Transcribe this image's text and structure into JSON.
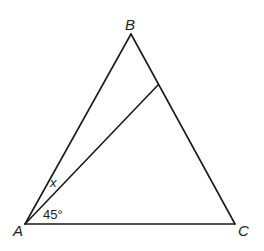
{
  "diagram": {
    "type": "triangle",
    "vertices": {
      "A": {
        "label": "A",
        "x": 25,
        "y": 224
      },
      "B": {
        "label": "B",
        "x": 131,
        "y": 34
      },
      "C": {
        "label": "C",
        "x": 235,
        "y": 224
      }
    },
    "interior_segment": {
      "from": "A",
      "to_point_on": "BC",
      "x": 158,
      "y": 85
    },
    "angle_labels": {
      "x": "x",
      "angle_45": "45°"
    },
    "colors": {
      "stroke": "#1a1a1a",
      "text": "#222222",
      "background": "#ffffff"
    }
  }
}
